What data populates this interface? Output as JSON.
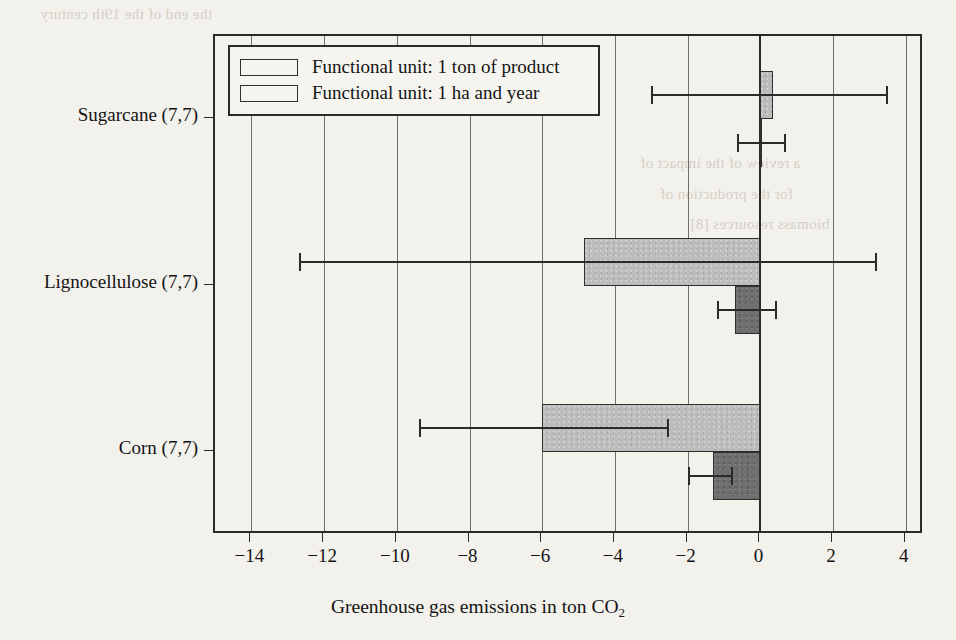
{
  "chart_data": {
    "type": "bar",
    "orientation": "horizontal",
    "title": "",
    "xlabel": "Greenhouse gas emissions in ton CO2",
    "xlabel_parts": {
      "main": "Greenhouse gas emissions in ton CO",
      "sub": "2"
    },
    "ylabel": "",
    "xlim": [
      -15,
      4.5
    ],
    "ylim": [
      0,
      3
    ],
    "xticks": [
      -14,
      -12,
      -10,
      -8,
      -6,
      -4,
      -2,
      0,
      2,
      4
    ],
    "xticklabels": [
      "−14",
      "−12",
      "−10",
      "−8",
      "−6",
      "−4",
      "−2",
      "0",
      "2",
      "4"
    ],
    "grid": "vertical",
    "zero_line": 0,
    "categories": [
      "Sugarcane (7,7)",
      "Lignocellulose (7,7)",
      "Corn (7,7)"
    ],
    "legend_position": "upper left",
    "series": [
      {
        "name": "Functional unit: 1 ton of product",
        "color": "#6f6f6f",
        "values": [
          -0.02,
          -0.7,
          -1.3
        ],
        "err_low": [
          -0.65,
          -1.2,
          -2.0
        ],
        "err_high": [
          0.7,
          0.45,
          -0.75
        ]
      },
      {
        "name": "Functional unit: 1 ha and year",
        "color": "#bcbcbc",
        "values": [
          0.35,
          -4.85,
          -6.0
        ],
        "err_low": [
          -3.0,
          -12.7,
          -9.4
        ],
        "err_high": [
          3.5,
          3.2,
          -2.5
        ]
      }
    ]
  },
  "legend": {
    "items": [
      {
        "label": "Functional unit: 1 ton of product",
        "swatch": "#6f6f6f"
      },
      {
        "label": "Functional unit: 1 ha and year",
        "swatch": "#bcbcbc"
      }
    ]
  },
  "page_bleed": [
    "the end of the 19th century",
    "a review of the impact of",
    "for the production of",
    "biomass resources [8]"
  ]
}
